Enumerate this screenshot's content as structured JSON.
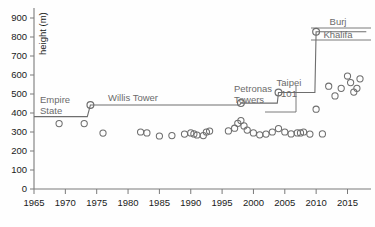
{
  "chart_data": {
    "type": "scatter",
    "title": "",
    "xlabel": "",
    "ylabel": "height (m)",
    "xlim": [
      1965,
      2018
    ],
    "ylim": [
      0,
      900
    ],
    "grid": false,
    "legend": false,
    "xticks": [
      1965,
      1970,
      1975,
      1980,
      1985,
      1990,
      1995,
      2000,
      2005,
      2010,
      2015
    ],
    "yticks": [
      0,
      100,
      200,
      300,
      400,
      500,
      600,
      700,
      800,
      900
    ],
    "series": [
      {
        "name": "Tallest building completed",
        "marker": "open-circle",
        "x": [
          1969,
          1973,
          1976,
          1982,
          1983,
          1985,
          1987,
          1989,
          1990,
          1990.5,
          1991,
          1992,
          1992.5,
          1993,
          1996,
          1997,
          1997.5,
          1998,
          1998.5,
          1999,
          2000,
          2001,
          2002,
          2003,
          2004,
          2005,
          2006,
          2007,
          2007.5,
          2008,
          2009,
          2010,
          2011,
          2012,
          2013,
          2014,
          2015,
          2015.5,
          2016,
          2016.5,
          2017
        ],
        "y": [
          344,
          344,
          294,
          300,
          295,
          279,
          281,
          289,
          295,
          290,
          284,
          281,
          300,
          305,
          306,
          320,
          346,
          360,
          332,
          310,
          295,
          285,
          289,
          300,
          318,
          300,
          290,
          295,
          295,
          300,
          289,
          420,
          290,
          541,
          490,
          530,
          595,
          560,
          510,
          530,
          580
        ]
      }
    ],
    "record_line": {
      "name": "Record height over time",
      "style": "step",
      "points": [
        {
          "year": 1965,
          "height": 381
        },
        {
          "year": 1973.5,
          "height": 381
        },
        {
          "year": 1974,
          "height": 442
        },
        {
          "year": 1997.8,
          "height": 442
        },
        {
          "year": 1998,
          "height": 452
        },
        {
          "year": 2003.8,
          "height": 452
        },
        {
          "year": 2004,
          "height": 508
        },
        {
          "year": 2009.8,
          "height": 508
        },
        {
          "year": 2010,
          "height": 828
        },
        {
          "year": 2018,
          "height": 828
        }
      ],
      "markers": [
        {
          "year": 1974,
          "height": 442
        },
        {
          "year": 1998,
          "height": 452
        },
        {
          "year": 2004,
          "height": 508
        },
        {
          "year": 2010,
          "height": 828
        }
      ]
    },
    "annotations": [
      {
        "id": "empire-state",
        "label_line1": "Empire",
        "label_line2": "State",
        "year": 1965,
        "height": 381
      },
      {
        "id": "willis-tower",
        "label_line1": "Willis  Tower",
        "label_line2": "",
        "year": 1974,
        "height": 442
      },
      {
        "id": "petronas-towers",
        "label_line1": "Petronas",
        "label_line2": "Towers",
        "year": 1998,
        "height": 452
      },
      {
        "id": "taipei-101",
        "label_line1": "Taipei",
        "label_line2": "101",
        "year": 2004,
        "height": 508
      },
      {
        "id": "burj-khalifa",
        "label_line1": "Burj",
        "label_line2": "Khalifa",
        "year": 2010,
        "height": 828
      }
    ],
    "colors": {
      "axis": "#7a7a7a",
      "marker_stroke": "#6e6e6e",
      "record_line": "#6e6e6e",
      "annotation_text": "#6b6b6b",
      "tick_text": "#1a1a1a",
      "background": "#fefefe"
    }
  },
  "axis": {
    "y_title": "height (m)",
    "y_ticks": [
      "900",
      "800",
      "700",
      "600",
      "500",
      "400",
      "300",
      "200",
      "100",
      "0"
    ],
    "x_ticks": [
      "1965",
      "1970",
      "1975",
      "1980",
      "1985",
      "1990",
      "1995",
      "2000",
      "2005",
      "2010",
      "2015"
    ]
  },
  "labels": {
    "empire_state_1": "Empire",
    "empire_state_2": "State",
    "willis_tower": "Willis  Tower",
    "petronas_1": "Petronas",
    "petronas_2": "Towers",
    "taipei_1": "Taipei",
    "taipei_2": "101",
    "burj_1": "Burj",
    "burj_2": "Khalifa"
  }
}
